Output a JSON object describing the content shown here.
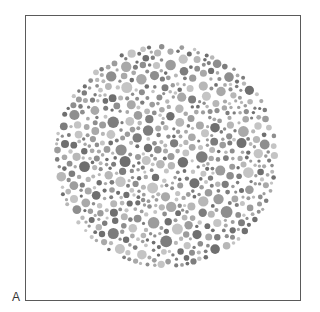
{
  "figure": {
    "panel_label": "A"
  },
  "plate": {
    "center": [
      166,
      156
    ],
    "radius": 112,
    "palette": [
      "#6f6f6f",
      "#7d7d7d",
      "#8e8e8e",
      "#9c9c9c",
      "#a9a9a9",
      "#b7b7b7",
      "#c4c4c4"
    ],
    "dot_radius_range": [
      1.6,
      6.2
    ],
    "frame_color": "#5a5a5a"
  }
}
